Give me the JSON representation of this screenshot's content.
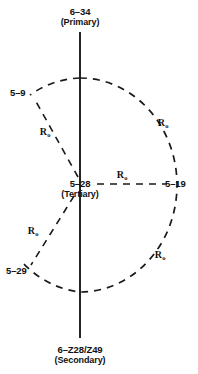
{
  "diagram": {
    "type": "set-relation-network",
    "background_color": "#ffffff",
    "stroke_color": "#1a1a1a",
    "nodes": [
      {
        "id": "primary",
        "name": "6–34",
        "role": "(Primary)",
        "x": 80,
        "y": 14
      },
      {
        "id": "secondary",
        "name": "6–Z28/Z49",
        "role": "(Secondary)",
        "x": 80,
        "y": 352
      },
      {
        "id": "tertiary",
        "name": "5–28",
        "role": "(Tertiary)",
        "x": 80,
        "y": 184
      },
      {
        "id": "sat-upper-left",
        "name": "5–9",
        "role": "",
        "x": 23,
        "y": 93
      },
      {
        "id": "sat-right",
        "name": "5–19",
        "role": "",
        "x": 176,
        "y": 184
      },
      {
        "id": "sat-lower-left",
        "name": "5–29",
        "role": "",
        "x": 20,
        "y": 271
      }
    ],
    "edge_labels": [
      {
        "id": "r-upper-left",
        "text": "R",
        "sub": "o",
        "x": 45,
        "y": 131
      },
      {
        "id": "r-arc-upper-right",
        "text": "R",
        "sub": "o",
        "x": 163,
        "y": 122
      },
      {
        "id": "r-horizontal",
        "text": "R",
        "sub": "o",
        "x": 122,
        "y": 174
      },
      {
        "id": "r-lower-left",
        "text": "R",
        "sub": "o",
        "x": 33,
        "y": 230
      },
      {
        "id": "r-arc-lower-right",
        "text": "R",
        "sub": "o",
        "x": 160,
        "y": 254
      }
    ],
    "axis": {
      "id": "vertical-axis",
      "x": 80,
      "y_top": 32,
      "y_bottom": 338
    },
    "circle": {
      "id": "relation-circle",
      "cx": 80,
      "cy": 185,
      "rx": 97,
      "ry": 107,
      "dash": "7 6"
    }
  }
}
